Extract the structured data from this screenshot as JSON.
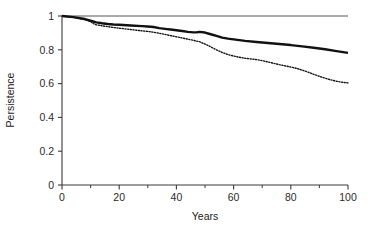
{
  "chart_data": {
    "type": "line",
    "title": "",
    "xlabel": "Years",
    "ylabel": "Persistence",
    "xlim": [
      0,
      100
    ],
    "ylim": [
      0,
      1
    ],
    "grid": false,
    "legend": "none",
    "xticks": [
      0,
      20,
      40,
      60,
      80,
      100
    ],
    "xtick_labels": [
      "0",
      "20",
      "40",
      "60",
      "80",
      "100"
    ],
    "xminor_ticks": [
      10,
      30,
      50,
      70,
      90
    ],
    "yticks": [
      0,
      0.2,
      0.4,
      0.6,
      0.8,
      1
    ],
    "ytick_labels": [
      "0",
      "0.2",
      "0.4",
      "0.6",
      "0.8",
      "1"
    ],
    "series": [
      {
        "name": "flat-reference",
        "style": "thin-solid",
        "color": "#555555",
        "width": 1.0,
        "x": [
          0,
          100
        ],
        "values": [
          1.0,
          1.0
        ]
      },
      {
        "name": "upper-curve",
        "style": "thick-solid",
        "color": "#111111",
        "width": 2.4,
        "x": [
          0,
          4,
          8,
          10,
          12,
          14,
          16,
          18,
          20,
          24,
          28,
          30,
          32,
          34,
          36,
          38,
          40,
          42,
          44,
          46,
          47,
          48,
          50,
          52,
          54,
          56,
          58,
          60,
          64,
          68,
          72,
          76,
          80,
          84,
          88,
          92,
          96,
          100
        ],
        "values": [
          1.0,
          0.993,
          0.982,
          0.972,
          0.962,
          0.957,
          0.953,
          0.95,
          0.948,
          0.944,
          0.94,
          0.938,
          0.935,
          0.928,
          0.924,
          0.92,
          0.916,
          0.911,
          0.906,
          0.903,
          0.903,
          0.906,
          0.902,
          0.892,
          0.882,
          0.872,
          0.866,
          0.862,
          0.853,
          0.846,
          0.84,
          0.834,
          0.828,
          0.82,
          0.812,
          0.803,
          0.792,
          0.782
        ]
      },
      {
        "name": "lower-curve",
        "style": "dotted",
        "color": "#111111",
        "width": 1.4,
        "x": [
          0,
          4,
          8,
          10,
          11,
          12,
          14,
          16,
          18,
          20,
          22,
          24,
          26,
          28,
          30,
          32,
          34,
          36,
          38,
          40,
          42,
          44,
          46,
          48,
          50,
          52,
          54,
          56,
          58,
          60,
          62,
          64,
          66,
          68,
          70,
          72,
          74,
          76,
          78,
          80,
          82,
          84,
          86,
          88,
          90,
          92,
          94,
          96,
          98,
          100
        ],
        "values": [
          1.0,
          0.992,
          0.979,
          0.968,
          0.955,
          0.948,
          0.942,
          0.937,
          0.932,
          0.928,
          0.924,
          0.92,
          0.916,
          0.912,
          0.909,
          0.904,
          0.898,
          0.891,
          0.884,
          0.877,
          0.87,
          0.863,
          0.856,
          0.848,
          0.834,
          0.818,
          0.8,
          0.784,
          0.772,
          0.763,
          0.756,
          0.75,
          0.746,
          0.742,
          0.736,
          0.728,
          0.72,
          0.712,
          0.705,
          0.698,
          0.69,
          0.68,
          0.668,
          0.655,
          0.643,
          0.632,
          0.622,
          0.614,
          0.608,
          0.604
        ]
      }
    ]
  },
  "axis": {
    "x_title": "Years",
    "y_title": "Persistence"
  }
}
